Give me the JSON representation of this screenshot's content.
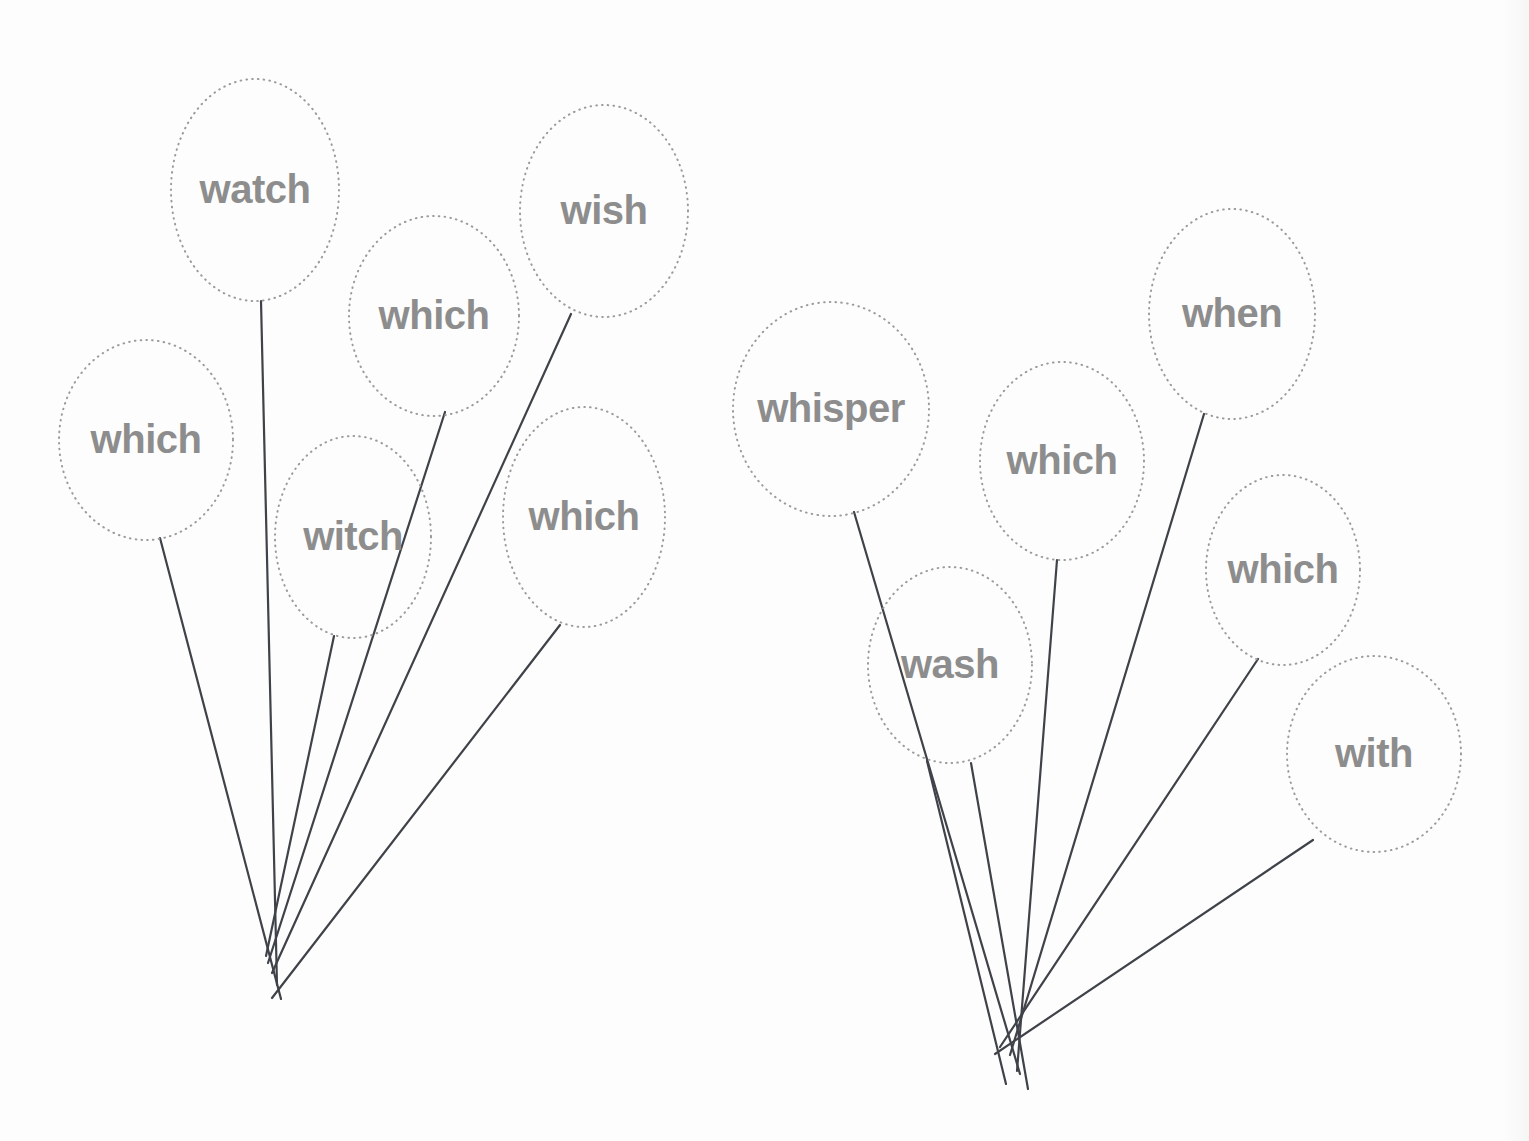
{
  "canvas": {
    "width": 1529,
    "height": 1141,
    "background_color": "#fdfdfd"
  },
  "style": {
    "balloon_outline_color": "#9b9b9b",
    "balloon_outline_style": "dotted",
    "string_color": "#3f4349",
    "word_color": "#8d8d8d"
  },
  "bunches": [
    {
      "id": "left-bunch",
      "name": "left-balloon-bunch",
      "knot": {
        "x": 276,
        "y": 952
      },
      "balloons": [
        {
          "word": "watch",
          "cx": 255,
          "cy": 190,
          "rx": 84,
          "ry": 111,
          "font_size": 40,
          "tie": {
            "x": 261,
            "y": 301
          },
          "string_end": {
            "x": 277,
            "y": 985
          }
        },
        {
          "word": "which",
          "cx": 146,
          "cy": 440,
          "rx": 87,
          "ry": 100,
          "font_size": 40,
          "tie": {
            "x": 160,
            "y": 538
          },
          "string_end": {
            "x": 281,
            "y": 999
          }
        },
        {
          "word": "which",
          "cx": 434,
          "cy": 316,
          "rx": 85,
          "ry": 100,
          "font_size": 40,
          "tie": {
            "x": 445,
            "y": 412
          },
          "string_end": {
            "x": 268,
            "y": 963
          }
        },
        {
          "word": "witch",
          "cx": 353,
          "cy": 537,
          "rx": 78,
          "ry": 101,
          "font_size": 40,
          "tie": {
            "x": 334,
            "y": 636
          },
          "string_end": {
            "x": 266,
            "y": 956
          }
        },
        {
          "word": "wish",
          "cx": 604,
          "cy": 211,
          "rx": 84,
          "ry": 106,
          "font_size": 40,
          "tie": {
            "x": 571,
            "y": 314
          },
          "string_end": {
            "x": 272,
            "y": 973
          }
        },
        {
          "word": "which",
          "cx": 584,
          "cy": 517,
          "rx": 81,
          "ry": 110,
          "font_size": 40,
          "tie": {
            "x": 560,
            "y": 625
          },
          "string_end": {
            "x": 272,
            "y": 998
          }
        }
      ]
    },
    {
      "id": "right-bunch",
      "name": "right-balloon-bunch",
      "knot": {
        "x": 1019,
        "y": 1045
      },
      "balloons": [
        {
          "word": "whisper",
          "cx": 831,
          "cy": 409,
          "rx": 98,
          "ry": 107,
          "font_size": 40,
          "tie": {
            "x": 854,
            "y": 512
          },
          "string_end": {
            "x": 1020,
            "y": 1074
          }
        },
        {
          "word": "wash",
          "cx": 950,
          "cy": 665,
          "rx": 82,
          "ry": 98,
          "font_size": 40,
          "tie": {
            "x": 927,
            "y": 761
          },
          "string_end": {
            "x": 1006,
            "y": 1084
          }
        },
        {
          "word": "wash-second-string",
          "is_extra_string": true,
          "tie": {
            "x": 971,
            "y": 763
          },
          "string_end": {
            "x": 1028,
            "y": 1089
          }
        },
        {
          "word": "which",
          "cx": 1062,
          "cy": 461,
          "rx": 82,
          "ry": 99,
          "font_size": 40,
          "tie": {
            "x": 1057,
            "y": 560
          },
          "string_end": {
            "x": 1017,
            "y": 1071
          }
        },
        {
          "word": "when",
          "cx": 1232,
          "cy": 314,
          "rx": 83,
          "ry": 105,
          "font_size": 40,
          "tie": {
            "x": 1204,
            "y": 414
          },
          "string_end": {
            "x": 1010,
            "y": 1055
          }
        },
        {
          "word": "which",
          "cx": 1283,
          "cy": 570,
          "rx": 77,
          "ry": 95,
          "font_size": 40,
          "tie": {
            "x": 1258,
            "y": 659
          },
          "string_end": {
            "x": 1000,
            "y": 1047
          }
        },
        {
          "word": "with",
          "cx": 1374,
          "cy": 754,
          "rx": 87,
          "ry": 98,
          "font_size": 40,
          "tie": {
            "x": 1313,
            "y": 840
          },
          "string_end": {
            "x": 995,
            "y": 1054
          }
        }
      ]
    }
  ]
}
